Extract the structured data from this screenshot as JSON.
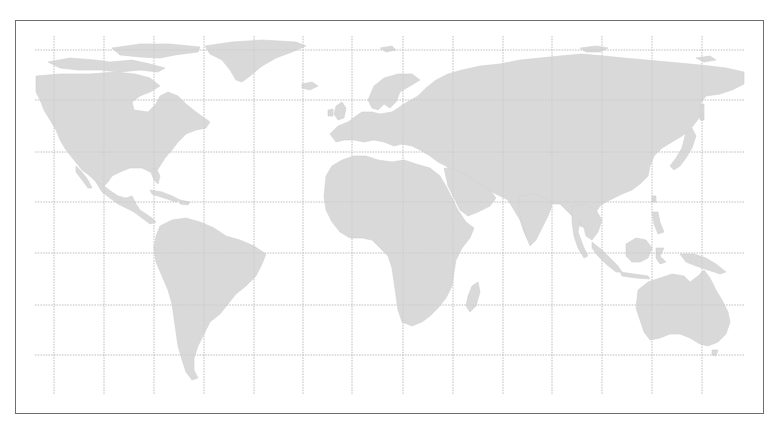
{
  "map": {
    "type": "world-map",
    "projection": "equirectangular",
    "style": "grayscale dotted land with graticule",
    "colors": {
      "background": "#ffffff",
      "land": "#d9d9d9",
      "grid": "#c8c8c8",
      "frame_border": "#6e6e6e"
    },
    "frame": {
      "x": 15,
      "y": 20,
      "width": 749,
      "height": 394
    },
    "graticule": {
      "extent": {
        "x_min": 35,
        "x_max": 745,
        "y_min": 36,
        "y_max": 395
      },
      "vertical_lines_x": [
        54,
        104,
        154,
        204,
        254,
        303,
        352,
        403,
        453,
        503,
        552,
        602,
        652,
        702
      ],
      "horizontal_lines_y": [
        50,
        100,
        152,
        202,
        253,
        305,
        355
      ]
    },
    "regions": [
      {
        "name": "North America"
      },
      {
        "name": "Greenland"
      },
      {
        "name": "Central America"
      },
      {
        "name": "Caribbean"
      },
      {
        "name": "South America"
      },
      {
        "name": "Europe"
      },
      {
        "name": "Africa"
      },
      {
        "name": "Madagascar"
      },
      {
        "name": "Asia"
      },
      {
        "name": "Arabian Peninsula"
      },
      {
        "name": "India"
      },
      {
        "name": "Southeast Asia"
      },
      {
        "name": "Japan"
      },
      {
        "name": "Indonesia"
      },
      {
        "name": "New Guinea"
      },
      {
        "name": "Australia"
      },
      {
        "name": "Tasmania"
      },
      {
        "name": "Iceland"
      },
      {
        "name": "British Isles"
      }
    ]
  }
}
